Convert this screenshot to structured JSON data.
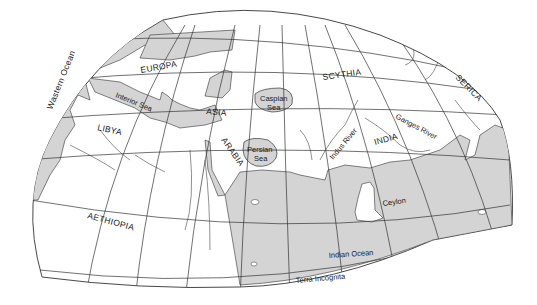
{
  "map": {
    "title": "",
    "colors": {
      "water": "#d4d4d4",
      "land": "#ffffff",
      "line": "#333333",
      "background": "#ffffff"
    },
    "regions": {
      "europa": "EUROPA",
      "scythia": "SCYTHIA",
      "serica": "SERICA",
      "asia": "ASIA",
      "libya": "LIBYA",
      "arabia": "ARABIA",
      "india": "INDIA",
      "aethiopia": "AETHIOPIA",
      "ceylon": "Ceylon",
      "terra_incognita": "Terra Incognita"
    },
    "water_bodies": {
      "western_ocean": "Wastern Ocean",
      "interior_sea": "Interior Sea",
      "caspian_sea_line1": "Caspian",
      "caspian_sea_line2": "Sea",
      "persian_sea_line1": "Persian",
      "persian_sea_line2": "Sea",
      "indian_ocean": "Indian Ocean"
    },
    "rivers": {
      "indus": "Indus River",
      "ganges": "Ganges River"
    }
  }
}
